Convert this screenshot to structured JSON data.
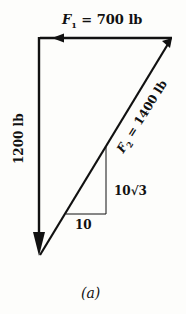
{
  "diagram": {
    "caption": "(a)",
    "forces": {
      "f1": {
        "symbol": "F",
        "subscript": "1",
        "equals": " = 700 lb",
        "magnitude": 700,
        "unit": "lb",
        "direction": "left"
      },
      "vertical": {
        "label": "1200 lb",
        "magnitude": 1200,
        "unit": "lb",
        "direction": "down"
      },
      "f2": {
        "symbol": "F",
        "subscript": "2",
        "equals": " = 1400 lb",
        "magnitude": 1400,
        "unit": "lb",
        "direction": "up-right"
      }
    },
    "slope_triangle": {
      "rise_label": "10√3",
      "run_label": "10"
    }
  }
}
